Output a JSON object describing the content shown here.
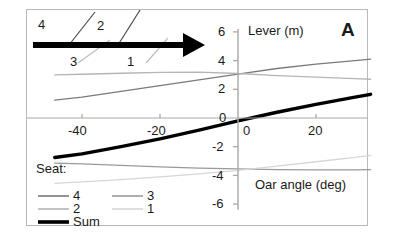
{
  "panel": {
    "label": "A"
  },
  "axes": {
    "y_title": "Lever (m)",
    "x_title": "Oar angle (deg)",
    "y_ticks": [
      "6",
      "4",
      "2",
      "0",
      "-2",
      "-4",
      "-6"
    ],
    "x_ticks": [
      "-40",
      "-20",
      "0",
      "20"
    ]
  },
  "legend": {
    "header": "Seat:",
    "items": [
      {
        "label": "4",
        "color": "#7a7a7a"
      },
      {
        "label": "3",
        "color": "#9a9a9a"
      },
      {
        "label": "2",
        "color": "#b5b5b5"
      },
      {
        "label": "1",
        "color": "#d6d6d6"
      },
      {
        "label": "Sum",
        "color": "#000000"
      }
    ]
  },
  "annotations": {
    "arrow_label": "direction of increasing seat number",
    "callouts": [
      {
        "label": "4"
      },
      {
        "label": "2"
      },
      {
        "label": "3"
      },
      {
        "label": "1"
      }
    ]
  },
  "chart_data": {
    "type": "line",
    "title": "",
    "xlabel": "Oar angle (deg)",
    "ylabel": "Lever (m)",
    "xlim": [
      -47,
      34
    ],
    "ylim": [
      -6,
      6
    ],
    "xticks": [
      -40,
      -20,
      0,
      20
    ],
    "yticks": [
      -6,
      -4,
      -2,
      0,
      2,
      4,
      6
    ],
    "grid": false,
    "legend_position": "lower-left",
    "x": [
      -47,
      -40,
      -30,
      -20,
      -10,
      0,
      10,
      20,
      30,
      34
    ],
    "series": [
      {
        "name": "4",
        "color": "#7a7a7a",
        "width": 1.3,
        "values": [
          1.25,
          1.45,
          1.85,
          2.25,
          2.65,
          3.05,
          3.45,
          3.75,
          4.0,
          4.1
        ]
      },
      {
        "name": "3",
        "color": "#9a9a9a",
        "width": 1.3,
        "values": [
          -3.15,
          -3.2,
          -3.3,
          -3.4,
          -3.5,
          -3.55,
          -3.6,
          -3.62,
          -3.62,
          -3.6
        ]
      },
      {
        "name": "2",
        "color": "#b5b5b5",
        "width": 1.3,
        "values": [
          3.0,
          3.05,
          3.12,
          3.18,
          3.2,
          3.1,
          2.95,
          2.85,
          2.75,
          2.7
        ]
      },
      {
        "name": "1",
        "color": "#d6d6d6",
        "width": 1.3,
        "values": [
          -4.55,
          -4.45,
          -4.3,
          -4.1,
          -3.9,
          -3.65,
          -3.35,
          -3.05,
          -2.75,
          -2.6
        ]
      },
      {
        "name": "Sum",
        "color": "#000000",
        "width": 3.4,
        "values": [
          -2.75,
          -2.5,
          -2.0,
          -1.45,
          -0.85,
          -0.2,
          0.4,
          0.95,
          1.45,
          1.65
        ]
      }
    ]
  }
}
